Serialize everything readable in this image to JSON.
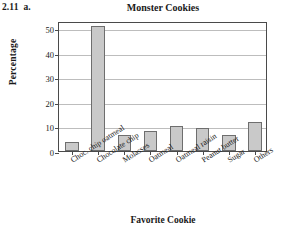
{
  "exercise": {
    "number": "2.11",
    "part": "a."
  },
  "chart_data": {
    "type": "bar",
    "title": "Monster Cookies",
    "xlabel": "Favorite Cookie",
    "ylabel": "Percentage",
    "categories": [
      "Choc. chip oatmeal",
      "Chocolate chip",
      "Molasses",
      "Oatmeal",
      "Oatmeal raisin",
      "Peanut butter",
      "Sugar",
      "Others"
    ],
    "values": [
      3.5,
      51,
      6.5,
      8,
      10,
      9.5,
      6.5,
      12
    ],
    "ylim": [
      0,
      53
    ],
    "yticks": [
      0,
      10,
      20,
      30,
      40,
      50
    ],
    "ytick_labels": [
      "0",
      "10",
      "20",
      "30",
      "40",
      "50"
    ],
    "grid": "horizontal",
    "legend": "none",
    "bar_color": "#c9c9c9",
    "bar_edge_color": "#6e6e6e",
    "axis_color": "#4a4a4a",
    "grid_color": "#bdbdbd",
    "background": "#ffffff"
  }
}
